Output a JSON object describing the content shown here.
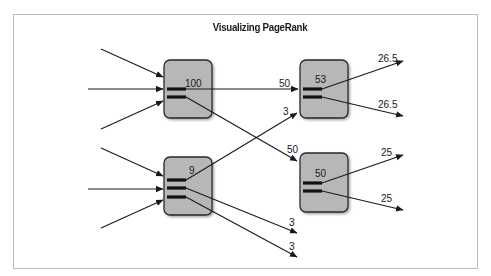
{
  "title": "Visualizing PageRank",
  "nodes": [
    {
      "id": "A",
      "rank": "100",
      "x": 164,
      "y": 60,
      "w": 48,
      "h": 58,
      "links": 2
    },
    {
      "id": "B",
      "rank": "9",
      "x": 164,
      "y": 157,
      "w": 48,
      "h": 58,
      "links": 3
    },
    {
      "id": "C",
      "rank": "53",
      "x": 300,
      "y": 60,
      "w": 48,
      "h": 58,
      "links": 2
    },
    {
      "id": "D",
      "rank": "50",
      "x": 300,
      "y": 153,
      "w": 48,
      "h": 59,
      "links": 2
    }
  ],
  "edge_labels": {
    "a_to_c": "50",
    "a_to_d": "50",
    "b_to_c": "3",
    "b_out_1": "3",
    "b_out_2": "3",
    "c_out_1": "26.5",
    "c_out_2": "26.5",
    "d_out_1": "25",
    "d_out_2": "25"
  },
  "colors": {
    "node_fill": "#b7b7b7",
    "stroke": "#1a1a1a",
    "border": "#bdbdbd"
  }
}
